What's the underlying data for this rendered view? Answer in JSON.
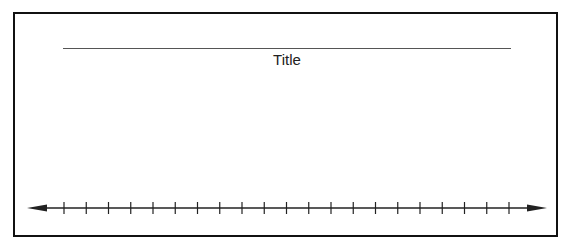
{
  "diagram": {
    "type": "number-line-worksheet",
    "title_label": "Title",
    "number_line": {
      "tick_count": 21,
      "arrows": [
        "left",
        "right"
      ],
      "tick_labels": []
    },
    "colors": {
      "stroke": "#222222",
      "title_line": "#555555",
      "background": "#ffffff"
    }
  }
}
